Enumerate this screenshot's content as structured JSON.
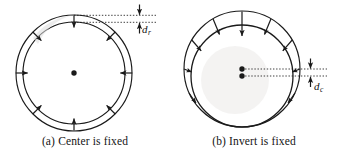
{
  "figure": {
    "background_color": "#ffffff",
    "line_color": "#1a1a1a",
    "panels": [
      {
        "id": "a",
        "caption": "(a) Center is fixed",
        "description": "Two concentric circles with eight inward-pointing arrows between them and a single fixed center dot",
        "dimension": {
          "symbol": "d",
          "subscript": "r",
          "full": "dr",
          "measures": "radial gap between outer and inner circle at the top"
        },
        "geometry": {
          "outer_circle": {
            "cx": 74,
            "cy": 73,
            "r": 58
          },
          "inner_circle": {
            "cx": 74,
            "cy": 73,
            "r": 51
          },
          "center_dot": {
            "cx": 74,
            "cy": 73,
            "r": 2.6
          },
          "arrow_count": 8,
          "arrow_angles_deg": [
            90,
            45,
            0,
            315,
            270,
            225,
            180,
            135
          ]
        }
      },
      {
        "id": "b",
        "caption": "(b) Invert is fixed",
        "description": "Two offset circles tangent near the bottom with inward arrows over the upper arc and two center dots",
        "dimension": {
          "symbol": "d",
          "subscript": "c",
          "full": "dc",
          "measures": "vertical offset between the two circle centers"
        },
        "geometry": {
          "outer_circle": {
            "cx": 73,
            "cy": 69,
            "r": 58
          },
          "inner_circle": {
            "cx": 73,
            "cy": 76,
            "r": 51
          },
          "outer_center_dot": {
            "cx": 73,
            "cy": 69,
            "r": 2.6
          },
          "inner_center_dot": {
            "cx": 73,
            "cy": 76,
            "r": 2.6
          },
          "arrow_count": 7,
          "arrow_angles_deg": [
            90,
            60,
            30,
            0,
            120,
            150,
            180
          ]
        }
      }
    ]
  }
}
